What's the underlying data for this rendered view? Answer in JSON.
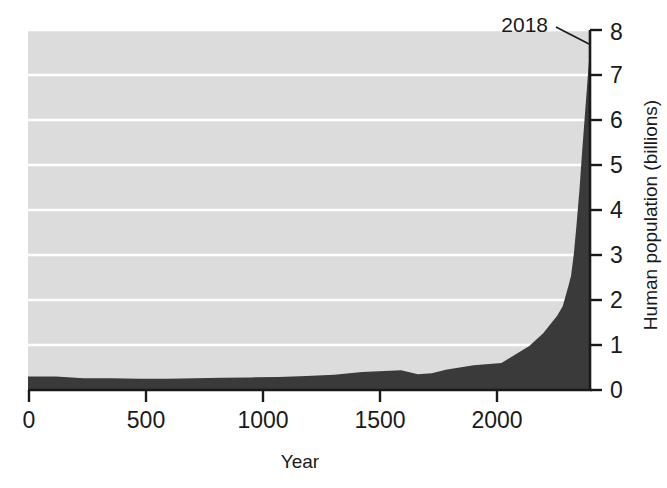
{
  "figure": {
    "background_color": "#ffffff",
    "plot_fill_color": "#dcdcdc",
    "area_fill_color": "#3a3a3a",
    "gridline_color": "#ffffff",
    "axis_color": "#1a1a1a"
  },
  "annotation": {
    "label": "2018",
    "leader_line": true
  },
  "axes": {
    "x": {
      "title": "Year",
      "ticks": [
        "0",
        "500",
        "1000",
        "1500",
        "2000"
      ],
      "tick_values": [
        0,
        500,
        1000,
        1500,
        2000
      ],
      "range": [
        0,
        2400
      ]
    },
    "y": {
      "title": "Human population (billions)",
      "ticks": [
        "0",
        "1",
        "2",
        "3",
        "4",
        "5",
        "6",
        "7",
        "8"
      ],
      "tick_values": [
        0,
        1,
        2,
        3,
        4,
        5,
        6,
        7,
        8
      ],
      "range": [
        0,
        8
      ],
      "side": "right"
    }
  },
  "chart_data": {
    "type": "area",
    "title": "",
    "xlabel": "Year",
    "ylabel": "Human population (billions)",
    "xlim": [
      0,
      2400
    ],
    "ylim": [
      0,
      8
    ],
    "grid": true,
    "legend": null,
    "annotations": [
      {
        "text": "2018",
        "x": 2018,
        "y": 7.6,
        "label_x": 1700,
        "label_y": 7.9
      }
    ],
    "series": [
      {
        "name": "Human population",
        "fill_color": "#3a3a3a",
        "x": [
          0,
          100,
          200,
          300,
          400,
          500,
          600,
          700,
          800,
          900,
          1000,
          1100,
          1200,
          1300,
          1340,
          1400,
          1450,
          1500,
          1600,
          1700,
          1750,
          1800,
          1850,
          1900,
          1920,
          1940,
          1950,
          1960,
          1970,
          1980,
          1990,
          2000,
          2010,
          2018
        ],
        "values": [
          0.3,
          0.3,
          0.26,
          0.26,
          0.25,
          0.25,
          0.26,
          0.27,
          0.28,
          0.29,
          0.31,
          0.34,
          0.4,
          0.43,
          0.44,
          0.35,
          0.37,
          0.45,
          0.55,
          0.6,
          0.79,
          0.98,
          1.26,
          1.65,
          1.86,
          2.3,
          2.54,
          3.03,
          3.7,
          4.44,
          5.32,
          6.14,
          6.96,
          7.6
        ]
      }
    ]
  }
}
